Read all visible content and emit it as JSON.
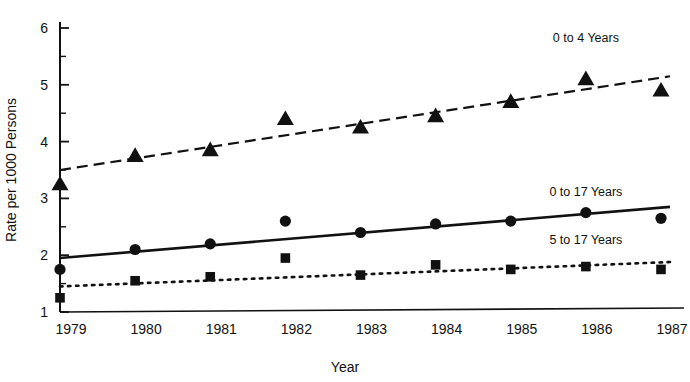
{
  "chart_data": {
    "type": "line",
    "title": "",
    "subtitle": "",
    "xlabel": "Year",
    "ylabel": "Rate per 1000 Persons",
    "x": [
      1979,
      1980,
      1981,
      1982,
      1983,
      1984,
      1985,
      1986,
      1987
    ],
    "categories": [
      "1979",
      "1980",
      "1981",
      "1982",
      "1983",
      "1984",
      "1985",
      "1986",
      "1987"
    ],
    "xlim": [
      1979,
      1987
    ],
    "ylim": [
      1,
      6
    ],
    "y_ticks": [
      1,
      2,
      3,
      4,
      5,
      6
    ],
    "y_tick_labels": [
      "1",
      "2",
      "3",
      "4",
      "5",
      "6"
    ],
    "y_minor_ticks": [
      1.5,
      2.5,
      3.5,
      4.5,
      5.5
    ],
    "grid": false,
    "legend_position": "inline-right",
    "series": [
      {
        "name": "0 to 4 Years",
        "marker": "triangle",
        "line_style": "dashed",
        "values": [
          3.25,
          3.75,
          3.85,
          4.4,
          4.25,
          4.45,
          4.7,
          5.1,
          4.9
        ],
        "trend_start": 3.5,
        "trend_end": 5.15,
        "label_x": 1986,
        "label_y": 5.75
      },
      {
        "name": "0 to 17 Years",
        "marker": "circle",
        "line_style": "solid",
        "values": [
          1.75,
          2.1,
          2.2,
          2.6,
          2.4,
          2.55,
          2.6,
          2.75,
          2.65
        ],
        "trend_start": 1.95,
        "trend_end": 2.85,
        "label_x": 1986,
        "label_y": 3.05
      },
      {
        "name": "5 to 17 Years",
        "marker": "square",
        "line_style": "dotted",
        "values": [
          1.25,
          1.55,
          1.62,
          1.95,
          1.65,
          1.83,
          1.75,
          1.8,
          1.75
        ],
        "trend_start": 1.45,
        "trend_end": 1.88,
        "label_x": 1986,
        "label_y": 2.2
      }
    ],
    "annotations": [
      {
        "text": "0 to 4 Years"
      },
      {
        "text": "0 to 17 Years"
      },
      {
        "text": "5 to 17 Years"
      }
    ]
  },
  "colors": {
    "ink": "#111111",
    "background": "#ffffff"
  }
}
